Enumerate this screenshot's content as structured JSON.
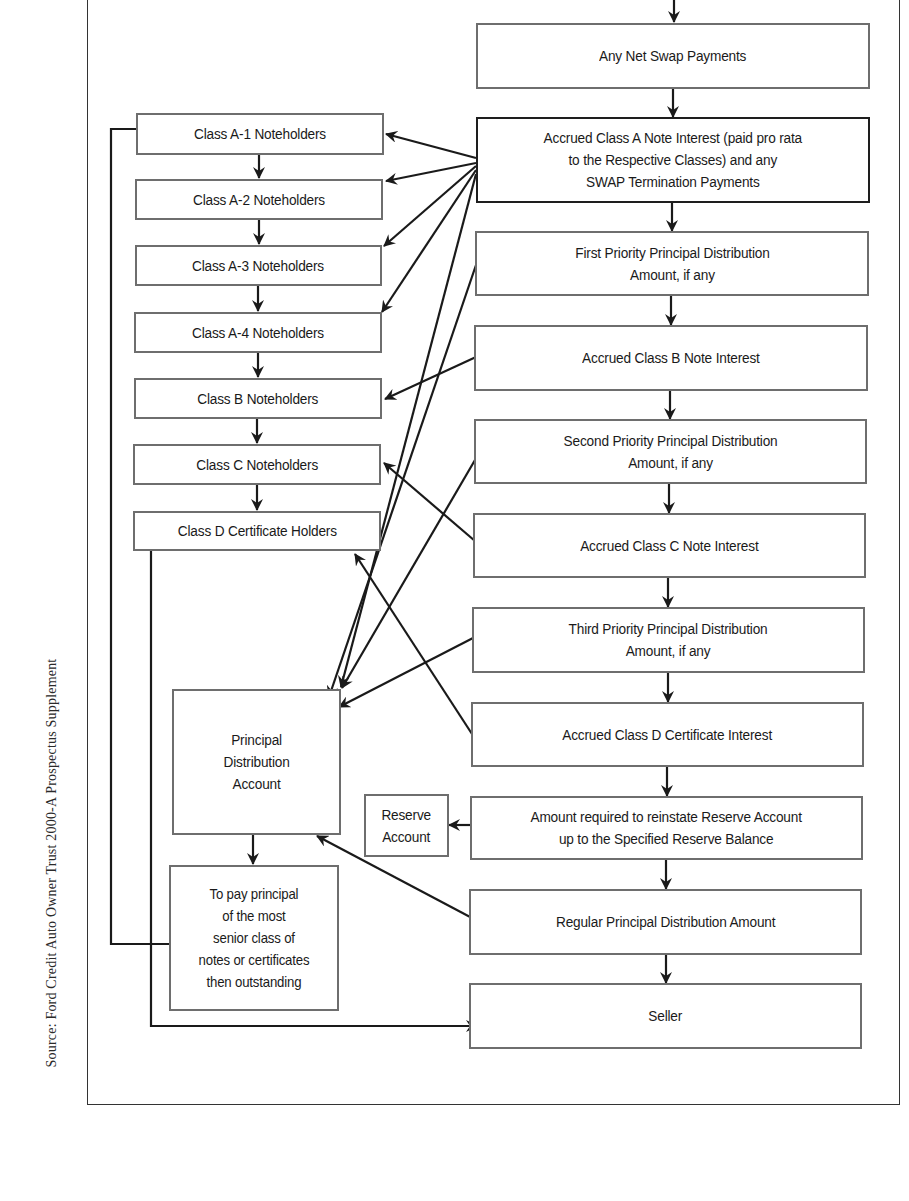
{
  "source_note": "Source: Ford Credit Auto Owner Trust 2000-A Prospectus Supplement",
  "waterfall": [
    {
      "id": "net_swap",
      "label": "Any Net Swap Payments"
    },
    {
      "id": "class_a_interest",
      "label": "Accrued Class A Note Interest (paid pro rata\nto the Respective Classes) and any\nSWAP Termination Payments"
    },
    {
      "id": "first_priority",
      "label": "First Priority Principal Distribution\nAmount, if any"
    },
    {
      "id": "class_b_interest",
      "label": "Accrued Class B Note Interest"
    },
    {
      "id": "second_priority",
      "label": "Second Priority Principal Distribution\nAmount, if any"
    },
    {
      "id": "class_c_interest",
      "label": "Accrued Class C Note Interest"
    },
    {
      "id": "third_priority",
      "label": "Third Priority Principal Distribution\nAmount, if any"
    },
    {
      "id": "class_d_interest",
      "label": "Accrued Class D Certificate Interest"
    },
    {
      "id": "reserve_reinstate",
      "label": "Amount required to reinstate Reserve Account\nup to the Specified Reserve Balance"
    },
    {
      "id": "regular_principal",
      "label": "Regular Principal Distribution Amount"
    },
    {
      "id": "seller",
      "label": "Seller"
    }
  ],
  "holders": [
    {
      "id": "a1",
      "label": "Class A-1 Noteholders"
    },
    {
      "id": "a2",
      "label": "Class A-2 Noteholders"
    },
    {
      "id": "a3",
      "label": "Class A-3 Noteholders"
    },
    {
      "id": "a4",
      "label": "Class A-4 Noteholders"
    },
    {
      "id": "b",
      "label": "Class B Noteholders"
    },
    {
      "id": "c",
      "label": "Class C Noteholders"
    },
    {
      "id": "d",
      "label": "Class D Certificate Holders"
    }
  ],
  "principal_account": {
    "label": "Principal\nDistribution\nAccount"
  },
  "pay_principal": {
    "label": "To pay principal\nof the most\nsenior class of\nnotes or certificates\nthen outstanding"
  },
  "reserve_account": {
    "label": "Reserve\nAccount"
  },
  "colors": {
    "box_border": "#6e6e6e",
    "emphasis_border": "#1e1e1e",
    "arrow": "#1a1a1a"
  }
}
